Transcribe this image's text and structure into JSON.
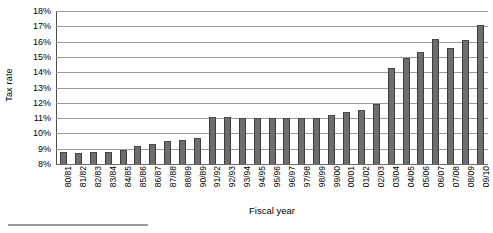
{
  "chart_data": {
    "type": "bar",
    "title": "",
    "subtitle": "",
    "xlabel": "Fiscal year",
    "ylabel": "Tax rate",
    "ylim": [
      8,
      18
    ],
    "ytick_values": [
      8,
      9,
      10,
      11,
      12,
      13,
      14,
      15,
      16,
      17,
      18
    ],
    "ytick_labels": [
      "8%",
      "9%",
      "10%",
      "11%",
      "12%",
      "13%",
      "14%",
      "15%",
      "16%",
      "17%",
      "18%"
    ],
    "grid": true,
    "legend": null,
    "legend_position": "none",
    "bar_color": "#6e6e6e",
    "bar_edge_color": "#3d3d3d",
    "gridline_color": "#9a9a9a",
    "axis_color": "#4d4d4d",
    "categories": [
      "80/81",
      "81/82",
      "82/83",
      "83/84",
      "84/85",
      "85/86",
      "86/87",
      "87/88",
      "88/89",
      "90/89",
      "91/92",
      "92/93",
      "93/94",
      "94/95",
      "95/96",
      "96/97",
      "97/98",
      "98/99",
      "99/00",
      "00/01",
      "01/02",
      "02/03",
      "03/04",
      "04/05",
      "05/06",
      "06/07",
      "07/08",
      "08/09",
      "09/10"
    ],
    "values": [
      8.8,
      8.7,
      8.8,
      8.8,
      8.9,
      9.2,
      9.3,
      9.5,
      9.6,
      9.7,
      11.1,
      11.1,
      11.0,
      11.0,
      11.0,
      11.0,
      11.0,
      11.0,
      11.2,
      11.4,
      11.5,
      11.9,
      14.3,
      14.9,
      15.3,
      16.2,
      15.6,
      16.1,
      17.1
    ]
  }
}
